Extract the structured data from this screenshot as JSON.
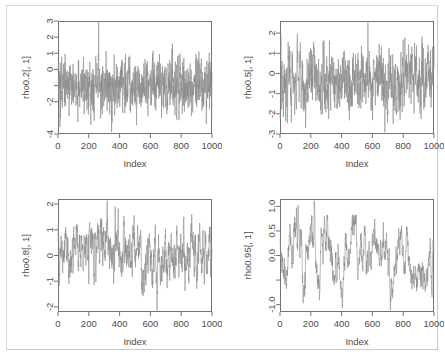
{
  "figure": {
    "width": 445,
    "height": 357,
    "background_color": "#ffffff",
    "frame_color": "#d9d9d9",
    "layout": "2x2",
    "trace_color": "#8c8c8c",
    "axis_color": "#737373",
    "text_color": "#4d4d4d"
  },
  "chart_data": [
    {
      "type": "line",
      "title": "",
      "xlabel": "Index",
      "ylabel": "rho0.2[, 1]",
      "panel_position": "top-left",
      "xlim": [
        0,
        1000
      ],
      "ylim": [
        -4.0,
        3.0
      ],
      "xticks": [
        0,
        200,
        400,
        600,
        800,
        1000
      ],
      "xtick_labels": [
        "0",
        "200",
        "400",
        "600",
        "800",
        "1000"
      ],
      "yticks": [
        -4,
        -2,
        -1,
        0,
        1,
        2,
        3
      ],
      "ytick_labels": [
        "-4",
        "-2",
        "",
        "0",
        "1",
        "2",
        "3"
      ],
      "grid": false,
      "legend": "none",
      "n_points": 1000,
      "series": [
        {
          "name": "rho0.2[, 1]",
          "model": "AR(1)",
          "rho": 0.2,
          "sd": 1.0,
          "seed": 20,
          "color": "#8c8c8c"
        }
      ]
    },
    {
      "type": "line",
      "title": "",
      "xlabel": "Index",
      "ylabel": "rho0.5[, 1]",
      "panel_position": "top-right",
      "xlim": [
        0,
        1000
      ],
      "ylim": [
        -3.0,
        2.6
      ],
      "xticks": [
        0,
        200,
        400,
        600,
        800,
        1000
      ],
      "xtick_labels": [
        "0",
        "200",
        "400",
        "600",
        "800",
        "1000"
      ],
      "yticks": [
        -3,
        -2,
        -1,
        0,
        1,
        2
      ],
      "ytick_labels": [
        "-3",
        "-2",
        "-1",
        "0",
        "1",
        "2"
      ],
      "grid": false,
      "legend": "none",
      "n_points": 1000,
      "series": [
        {
          "name": "rho0.5[, 1]",
          "model": "AR(1)",
          "rho": 0.5,
          "sd": 1.0,
          "seed": 50,
          "color": "#8c8c8c"
        }
      ]
    },
    {
      "type": "line",
      "title": "",
      "xlabel": "Index",
      "ylabel": "rho0.8[, 1]",
      "panel_position": "bottom-left",
      "xlim": [
        0,
        1000
      ],
      "ylim": [
        -2.2,
        2.2
      ],
      "xticks": [
        0,
        200,
        400,
        600,
        800,
        1000
      ],
      "xtick_labels": [
        "0",
        "200",
        "400",
        "600",
        "800",
        "1000"
      ],
      "yticks": [
        -2,
        -1,
        0,
        1,
        2
      ],
      "ytick_labels": [
        "-2",
        "-1",
        "0",
        "1",
        "2"
      ],
      "grid": false,
      "legend": "none",
      "n_points": 1000,
      "series": [
        {
          "name": "rho0.8[, 1]",
          "model": "AR(1)",
          "rho": 0.8,
          "sd": 1.0,
          "seed": 80,
          "color": "#8c8c8c"
        }
      ]
    },
    {
      "type": "line",
      "title": "",
      "xlabel": "Index",
      "ylabel": "rho0.95[, 1]",
      "panel_position": "bottom-right",
      "xlim": [
        0,
        1000
      ],
      "ylim": [
        -1.15,
        1.15
      ],
      "xticks": [
        0,
        200,
        400,
        600,
        800,
        1000
      ],
      "xtick_labels": [
        "0",
        "200",
        "400",
        "600",
        "800",
        "1000"
      ],
      "yticks": [
        -1.0,
        -0.5,
        0.0,
        0.5,
        1.0
      ],
      "ytick_labels": [
        "-1.0",
        "",
        "0.0",
        "0.5",
        "1.0"
      ],
      "grid": false,
      "legend": "none",
      "n_points": 1000,
      "series": [
        {
          "name": "rho0.95[, 1]",
          "model": "AR(1)",
          "rho": 0.95,
          "sd": 1.0,
          "seed": 95,
          "color": "#8c8c8c"
        }
      ]
    }
  ]
}
